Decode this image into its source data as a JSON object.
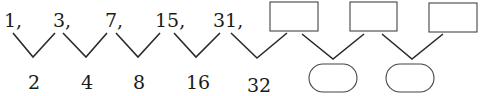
{
  "sequence": {
    "terms": [
      "1,",
      "3,",
      "7,",
      "15,",
      "31,"
    ],
    "blank_terms_count": 3,
    "differences": [
      "2",
      "4",
      "8",
      "16",
      "32"
    ],
    "blank_differences_count": 2
  }
}
